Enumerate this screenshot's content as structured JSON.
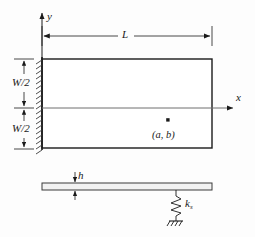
{
  "figure": {
    "type": "engineering-diagram",
    "colors": {
      "line": "#1a1a1a",
      "thin_line": "#6e6e6e",
      "background": "#fdfdfd",
      "plate_fill": "#f2f2f2"
    },
    "labels": {
      "axis_y": "y",
      "axis_x": "x",
      "length": "L",
      "half_width_top": "W/2",
      "half_width_bottom": "W/2",
      "point": "(a, b)",
      "thickness": "h",
      "spring": "k",
      "spring_subscript": "s"
    },
    "geometry": {
      "plate_left": 42,
      "plate_right": 212,
      "plate_top": 59,
      "plate_bottom": 148,
      "midline_y": 108,
      "dimension_line_y": 36,
      "point_x": 168,
      "point_y": 120,
      "side_view_top": 183,
      "side_view_bottom": 190,
      "spring_x": 176,
      "spring_bottom": 222
    }
  }
}
